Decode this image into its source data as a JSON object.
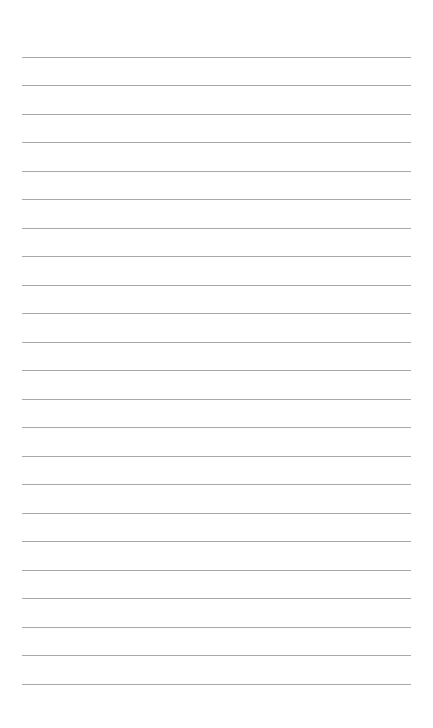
{
  "page": {
    "type": "lined-paper",
    "background_color": "#ffffff",
    "line_color": "#a9a9a9",
    "line_count": 23,
    "line_left": 22,
    "line_right": 411,
    "first_line_y": 57,
    "line_spacing": 28.48,
    "lines": [
      {
        "text": ""
      },
      {
        "text": ""
      },
      {
        "text": ""
      },
      {
        "text": ""
      },
      {
        "text": ""
      },
      {
        "text": ""
      },
      {
        "text": ""
      },
      {
        "text": ""
      },
      {
        "text": ""
      },
      {
        "text": ""
      },
      {
        "text": ""
      },
      {
        "text": ""
      },
      {
        "text": ""
      },
      {
        "text": ""
      },
      {
        "text": ""
      },
      {
        "text": ""
      },
      {
        "text": ""
      },
      {
        "text": ""
      },
      {
        "text": ""
      },
      {
        "text": ""
      },
      {
        "text": ""
      },
      {
        "text": ""
      },
      {
        "text": ""
      }
    ]
  }
}
